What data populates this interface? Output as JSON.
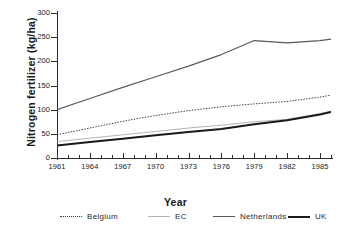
{
  "chart_data": {
    "type": "line",
    "title": "",
    "xlabel": "Year",
    "ylabel": "Nitrogen fertilizer (kg/ha)",
    "xlim": [
      1961,
      1986
    ],
    "ylim": [
      0,
      300
    ],
    "yticks": [
      0,
      50,
      100,
      150,
      200,
      250,
      300
    ],
    "ytick_labels": [
      "0",
      "50",
      "100",
      "150",
      "200",
      "250",
      "300"
    ],
    "xticks": [
      1961,
      1964,
      1967,
      1970,
      1973,
      1976,
      1979,
      1982,
      1985
    ],
    "xtick_labels": [
      "1961",
      "1964",
      "1967",
      "1970",
      "1973",
      "1976",
      "1979",
      "1982",
      "1985"
    ],
    "xticks_minor": [
      1962,
      1963,
      1965,
      1966,
      1968,
      1969,
      1971,
      1972,
      1974,
      1975,
      1977,
      1978,
      1980,
      1981,
      1983,
      1984,
      1986
    ],
    "grid": false,
    "legend_position": "below",
    "x": [
      1961,
      1964,
      1967,
      1970,
      1973,
      1976,
      1979,
      1982,
      1985,
      1986
    ],
    "series": [
      {
        "name": "Belgium",
        "style": "dotted",
        "color": "#3a3a3a",
        "width": 1.0,
        "values": [
          48,
          62,
          76,
          88,
          98,
          106,
          112,
          117,
          126,
          130
        ]
      },
      {
        "name": "EC",
        "style": "solid",
        "color": "#b4b4b4",
        "width": 1.0,
        "values": [
          34,
          41,
          48,
          55,
          62,
          68,
          75,
          80,
          92,
          97
        ]
      },
      {
        "name": "Netherlands",
        "style": "solid",
        "color": "#5a5a5a",
        "width": 1.2,
        "values": [
          100,
          123,
          146,
          168,
          190,
          214,
          243,
          238,
          243,
          246
        ]
      },
      {
        "name": "UK",
        "style": "solid",
        "color": "#1a1a1a",
        "width": 2.0,
        "values": [
          26,
          33,
          40,
          47,
          54,
          60,
          70,
          78,
          90,
          95
        ]
      }
    ]
  },
  "legend": {
    "items": [
      {
        "label": "Belgium"
      },
      {
        "label": "EC"
      },
      {
        "label": "Netherlands"
      },
      {
        "label": "UK"
      }
    ]
  }
}
